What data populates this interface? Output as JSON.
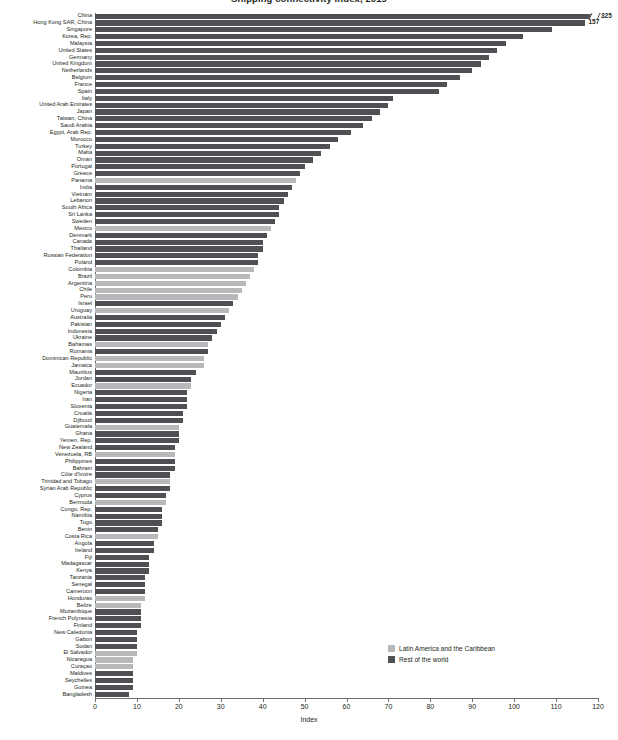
{
  "chart_data": {
    "type": "bar",
    "orientation": "horizontal",
    "title": "Shipping connectivity index, 2019",
    "xlabel": "Index",
    "ylabel": "",
    "xlim": [
      0,
      120
    ],
    "xticks": [
      0,
      10,
      20,
      30,
      40,
      50,
      60,
      70,
      80,
      90,
      100,
      110,
      120
    ],
    "grid": false,
    "legend_position": "bottom-right",
    "legend": [
      {
        "label": "Latin America and the Caribbean",
        "color": "#b7b8ba",
        "key": "lac"
      },
      {
        "label": "Rest of the world",
        "color": "#4f5053",
        "key": "row"
      }
    ],
    "categories": [
      "China",
      "Hong Kong SAR, China",
      "Singapore",
      "Korea, Rep.",
      "Malaysia",
      "United States",
      "Germany",
      "United Kingdom",
      "Netherlands",
      "Belgium",
      "France",
      "Spain",
      "Italy",
      "United Arab Emirates",
      "Japan",
      "Taiwan, China",
      "Saudi Arabia",
      "Egypt, Arab Rep.",
      "Morocco",
      "Turkey",
      "Malta",
      "Oman",
      "Portugal",
      "Greece",
      "Panama",
      "India",
      "Vietnam",
      "Lebanon",
      "South Africa",
      "Sri Lanka",
      "Sweden",
      "Mexico",
      "Denmark",
      "Canada",
      "Thailand",
      "Russian Federation",
      "Poland",
      "Colombia",
      "Brazil",
      "Argentina",
      "Chile",
      "Peru",
      "Israel",
      "Uruguay",
      "Australia",
      "Pakistan",
      "Indonesia",
      "Ukraine",
      "Bahamas",
      "Romania",
      "Dominican Republic",
      "Jamaica",
      "Mauritius",
      "Jordan",
      "Ecuador",
      "Nigeria",
      "Iran",
      "Slovenia",
      "Croatia",
      "Djibouti",
      "Guatemala",
      "Ghana",
      "Yemen, Rep.",
      "New Zealand",
      "Venezuela, RB",
      "Philippines",
      "Bahrain",
      "Côte d'Ivoire",
      "Trinidad and Tobago",
      "Syrian Arab Republic",
      "Cyprus",
      "Bermuda",
      "Congo, Rep.",
      "Namibia",
      "Togo",
      "Benin",
      "Costa Rica",
      "Angola",
      "Ireland",
      "Fiji",
      "Madagascar",
      "Kenya",
      "Tanzania",
      "Senegal",
      "Cameroon",
      "Honduras",
      "Belize",
      "Mozambique",
      "French Polynesia",
      "Finland",
      "New Caledonia",
      "Gabon",
      "Sudan",
      "El Salvador",
      "Nicaragua",
      "Curaçao",
      "Maldives",
      "Seychelles",
      "Guinea",
      "Bangladesh"
    ],
    "values": [
      123,
      117,
      109,
      102,
      98,
      96,
      94,
      92,
      90,
      87,
      84,
      82,
      71,
      70,
      68,
      66,
      64,
      61,
      58,
      56,
      54,
      52,
      50,
      49,
      48,
      47,
      46,
      45,
      44,
      44,
      43,
      42,
      41,
      40,
      40,
      39,
      39,
      38,
      37,
      36,
      35,
      34,
      33,
      32,
      31,
      30,
      29,
      28,
      27,
      27,
      26,
      26,
      24,
      23,
      23,
      22,
      22,
      22,
      21,
      21,
      20,
      20,
      20,
      19,
      19,
      19,
      19,
      18,
      18,
      18,
      17,
      17,
      16,
      16,
      16,
      15,
      15,
      14,
      14,
      13,
      13,
      13,
      12,
      12,
      12,
      12,
      11,
      11,
      11,
      11,
      10,
      10,
      10,
      10,
      9,
      9,
      9,
      9,
      9,
      8
    ],
    "group": [
      "row",
      "row",
      "row",
      "row",
      "row",
      "row",
      "row",
      "row",
      "row",
      "row",
      "row",
      "row",
      "row",
      "row",
      "row",
      "row",
      "row",
      "row",
      "row",
      "row",
      "row",
      "row",
      "row",
      "row",
      "lac",
      "row",
      "row",
      "row",
      "row",
      "row",
      "row",
      "lac",
      "row",
      "row",
      "row",
      "row",
      "row",
      "lac",
      "lac",
      "lac",
      "lac",
      "lac",
      "row",
      "lac",
      "row",
      "row",
      "row",
      "row",
      "lac",
      "row",
      "lac",
      "lac",
      "row",
      "row",
      "lac",
      "row",
      "row",
      "row",
      "row",
      "row",
      "lac",
      "row",
      "row",
      "row",
      "lac",
      "row",
      "row",
      "row",
      "lac",
      "row",
      "row",
      "lac",
      "row",
      "row",
      "row",
      "row",
      "lac",
      "row",
      "row",
      "row",
      "row",
      "row",
      "row",
      "row",
      "row",
      "lac",
      "lac",
      "row",
      "row",
      "row",
      "row",
      "row",
      "row",
      "lac",
      "lac",
      "lac",
      "row",
      "row",
      "row",
      "row"
    ],
    "data_labels": {
      "0": "325",
      "1": "157"
    },
    "axis_break_rows": [
      0
    ]
  }
}
